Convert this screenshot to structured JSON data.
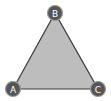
{
  "diagram": {
    "type": "triangle",
    "fill_color": "#bdbdbd",
    "stroke_color": "#3a3a3a",
    "node_fill": "#555555",
    "node_stroke": "#9a9a9a",
    "label_color": "#ffffff",
    "vertices": [
      {
        "label": "A",
        "x": 13,
        "y": 89
      },
      {
        "label": "B",
        "x": 55,
        "y": 13
      },
      {
        "label": "C",
        "x": 98,
        "y": 89
      }
    ]
  }
}
